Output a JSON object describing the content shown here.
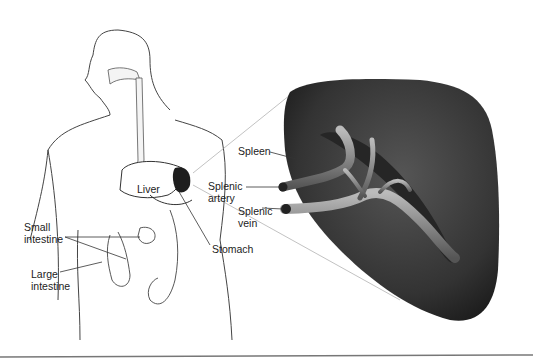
{
  "diagram": {
    "labels": {
      "spleen": "Spleen",
      "liver": "Liver",
      "splenic_artery": [
        "Splenic",
        "artery"
      ],
      "splenic_vein": [
        "Splenic",
        "vein"
      ],
      "stomach": "Stomach",
      "small_intestine": [
        "Small",
        "intestine"
      ],
      "large_intestine": [
        "Large",
        "intestine"
      ]
    },
    "colors": {
      "spleen": "#3a3a3a",
      "outline": "#333333",
      "organ_dark": "#1e1e1e"
    }
  }
}
